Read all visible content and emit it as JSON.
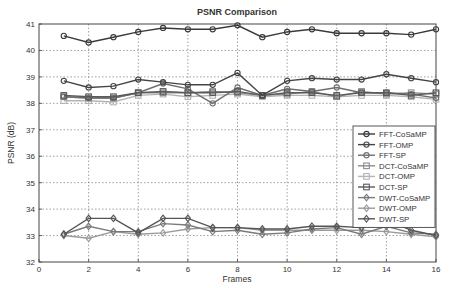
{
  "chart_data": {
    "type": "line",
    "title": "PSNR Comparison",
    "xlabel": "Frames",
    "ylabel": "PSNR (dB)",
    "xlim": [
      0,
      16
    ],
    "ylim": [
      32,
      41
    ],
    "xticks": [
      0,
      2,
      4,
      6,
      8,
      10,
      12,
      14,
      16
    ],
    "yticks": [
      32,
      33,
      34,
      35,
      36,
      37,
      38,
      39,
      40,
      41
    ],
    "grid": true,
    "legend_position": "right-center",
    "x": [
      1,
      2,
      3,
      4,
      5,
      6,
      7,
      8,
      9,
      10,
      11,
      12,
      13,
      14,
      15,
      16
    ],
    "series": [
      {
        "name": "FFT-CoSaMP",
        "marker": "circle",
        "color": "#3a3a3a",
        "values": [
          40.55,
          40.3,
          40.5,
          40.7,
          40.85,
          40.8,
          40.8,
          40.95,
          40.5,
          40.7,
          40.8,
          40.65,
          40.65,
          40.65,
          40.6,
          40.8
        ]
      },
      {
        "name": "FFT-OMP",
        "marker": "circle",
        "color": "#444444",
        "values": [
          38.85,
          38.6,
          38.65,
          38.9,
          38.8,
          38.7,
          38.7,
          39.15,
          38.3,
          38.85,
          38.95,
          38.9,
          38.9,
          39.1,
          38.95,
          38.8
        ]
      },
      {
        "name": "FFT-SP",
        "marker": "circle",
        "color": "#6e6e6e",
        "values": [
          38.25,
          38.2,
          38.2,
          38.4,
          38.75,
          38.55,
          38.0,
          38.6,
          38.3,
          38.55,
          38.45,
          38.6,
          38.4,
          38.4,
          38.35,
          38.2
        ]
      },
      {
        "name": "DCT-CoSaMP",
        "marker": "square",
        "color": "#8c8c8c",
        "values": [
          38.25,
          38.2,
          38.2,
          38.4,
          38.4,
          38.4,
          38.45,
          38.4,
          38.3,
          38.35,
          38.45,
          38.25,
          38.45,
          38.35,
          38.4,
          38.35
        ]
      },
      {
        "name": "DCT-OMP",
        "marker": "square",
        "color": "#b4b4b4",
        "values": [
          38.1,
          38.1,
          38.05,
          38.3,
          38.35,
          38.25,
          38.3,
          38.35,
          38.25,
          38.3,
          38.3,
          38.25,
          38.3,
          38.3,
          38.25,
          38.15
        ]
      },
      {
        "name": "DCT-SP",
        "marker": "square",
        "color": "#5a5a5a",
        "values": [
          38.3,
          38.25,
          38.25,
          38.4,
          38.45,
          38.4,
          38.4,
          38.45,
          38.3,
          38.4,
          38.4,
          38.3,
          38.4,
          38.4,
          38.3,
          38.4
        ]
      },
      {
        "name": "DWT-CoSaMP",
        "marker": "diamond",
        "color": "#7a7a7a",
        "values": [
          33.05,
          33.35,
          33.15,
          33.15,
          33.45,
          33.4,
          33.15,
          33.2,
          33.05,
          33.1,
          33.25,
          33.3,
          33.05,
          33.35,
          33.1,
          33.05
        ]
      },
      {
        "name": "DWT-OMP",
        "marker": "diamond",
        "color": "#9a9a9a",
        "values": [
          33.0,
          32.9,
          33.15,
          33.05,
          33.1,
          33.25,
          33.3,
          33.3,
          33.2,
          33.2,
          33.2,
          33.2,
          33.2,
          33.15,
          33.05,
          32.95
        ]
      },
      {
        "name": "DWT-SP",
        "marker": "diamond",
        "color": "#555555",
        "values": [
          33.05,
          33.65,
          33.65,
          33.1,
          33.65,
          33.65,
          33.3,
          33.3,
          33.25,
          33.25,
          33.35,
          33.35,
          33.3,
          33.6,
          33.2,
          33.0
        ]
      }
    ]
  }
}
